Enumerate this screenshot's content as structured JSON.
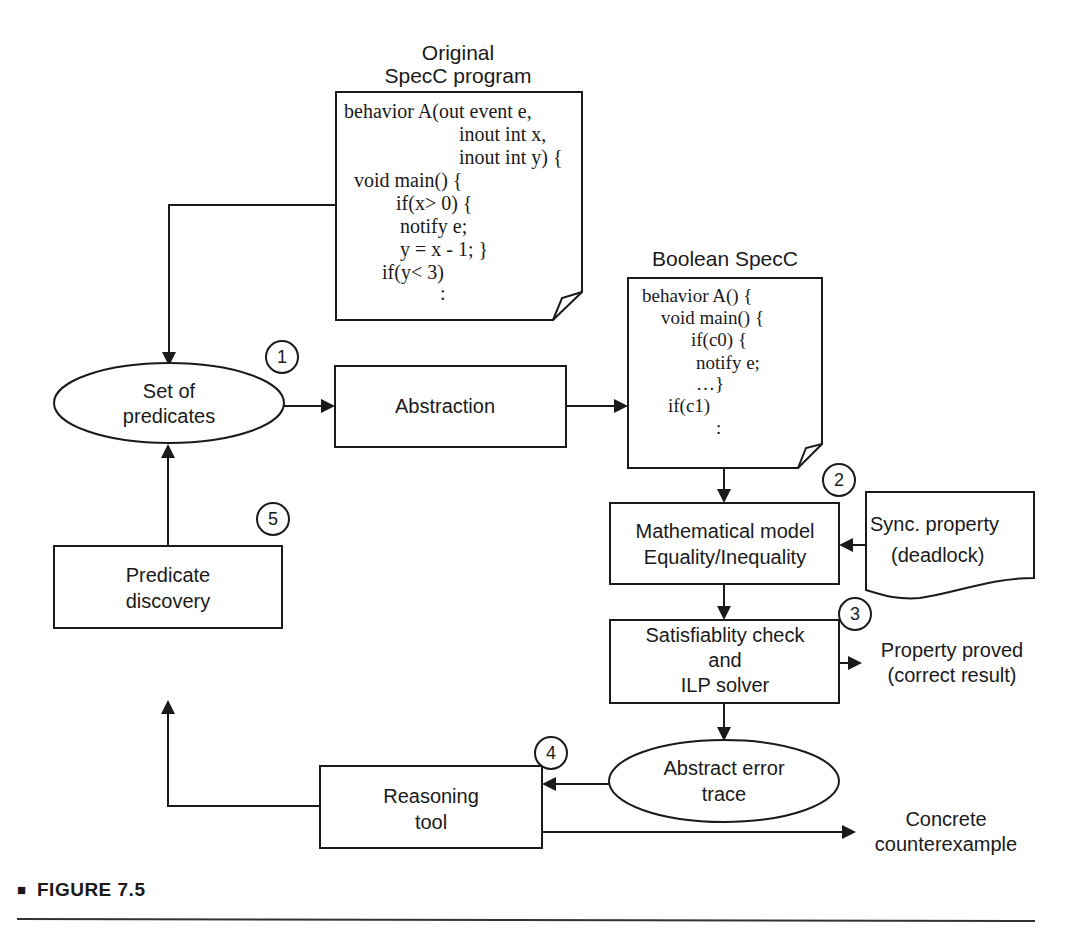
{
  "figure": {
    "caption": "FIGURE 7.5",
    "caption_marker": "■"
  },
  "nodes": {
    "original_program": {
      "title_line1": "Original",
      "title_line2": "SpecC  program",
      "code": [
        "behavior A(out event e,",
        "inout int x,",
        "inout int y) {",
        "void main() {",
        "if(x> 0) {",
        "notify e;",
        "y = x - 1; }",
        "if(y< 3)",
        ":"
      ]
    },
    "boolean_program": {
      "title": "Boolean SpecC",
      "code": [
        "behavior A() {",
        "void main() {",
        "if(c0) {",
        "notify  e;",
        "…}",
        "if(c1)",
        ":"
      ]
    },
    "set_of_predicates": {
      "line1": "Set of",
      "line2": "predicates",
      "step": "1"
    },
    "abstraction": {
      "label": "Abstraction"
    },
    "math_model": {
      "line1": "Mathematical model",
      "line2": "Equality/Inequality",
      "step": "2"
    },
    "sync_property": {
      "line1": "Sync. property",
      "line2": "(deadlock)"
    },
    "sat_check": {
      "line1": "Satisfiablity check",
      "line2": "and",
      "line3": "ILP solver",
      "step": "3"
    },
    "property_proved": {
      "line1": "Property proved",
      "line2": "(correct result)"
    },
    "abstract_error_trace": {
      "line1": "Abstract error",
      "line2": "trace"
    },
    "reasoning_tool": {
      "line1": "Reasoning",
      "line2": "tool",
      "step": "4"
    },
    "concrete_counterexample": {
      "line1": "Concrete",
      "line2": "counterexample"
    },
    "predicate_discovery": {
      "line1": "Predicate",
      "line2": "discovery",
      "step": "5"
    }
  },
  "colors": {
    "ink": "#1a1a1a",
    "background": "#ffffff"
  }
}
